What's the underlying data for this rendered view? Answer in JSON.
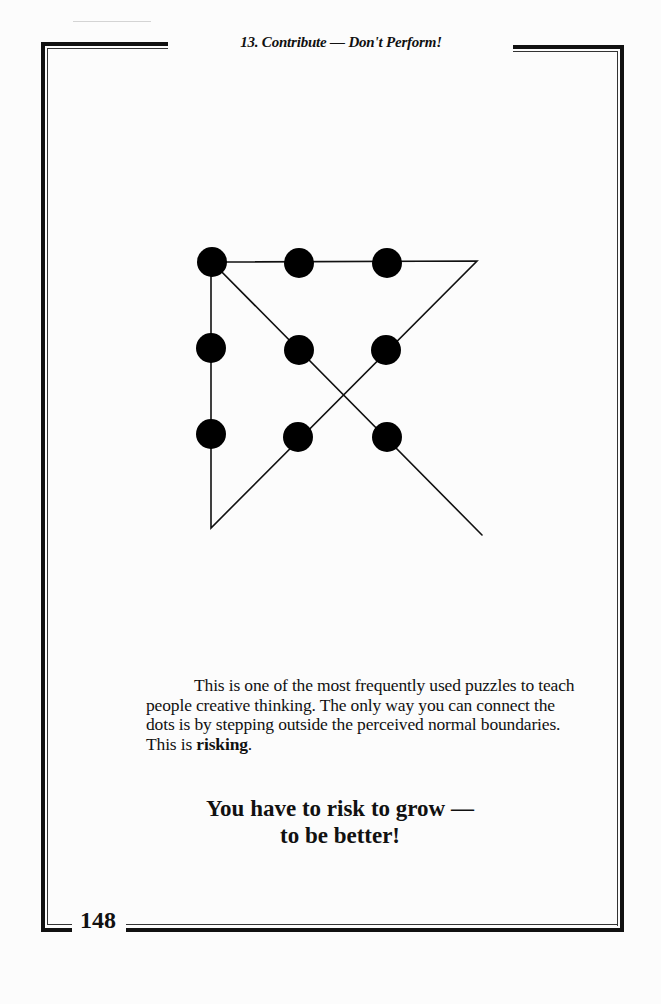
{
  "header": {
    "running_head": "13. Contribute — Don't Perform!"
  },
  "figure": {
    "dot_color": "#000000",
    "line_color": "#111111",
    "dots": [
      {
        "row": 1,
        "col": 1
      },
      {
        "row": 1,
        "col": 2
      },
      {
        "row": 1,
        "col": 3
      },
      {
        "row": 2,
        "col": 1
      },
      {
        "row": 2,
        "col": 2
      },
      {
        "row": 2,
        "col": 3
      },
      {
        "row": 3,
        "col": 1
      },
      {
        "row": 3,
        "col": 2
      },
      {
        "row": 3,
        "col": 3
      }
    ]
  },
  "body": {
    "paragraph_part1": "This is one of the most frequently used puzzles to teach people creative thinking.  The only way you can connect the dots is by stepping outside the perceived normal boundaries.  This is ",
    "paragraph_bold": "risking",
    "paragraph_end": ".",
    "emphasis_line1": "You have to risk to grow —",
    "emphasis_line2": "to be better!"
  },
  "footer": {
    "page_number": "148"
  }
}
